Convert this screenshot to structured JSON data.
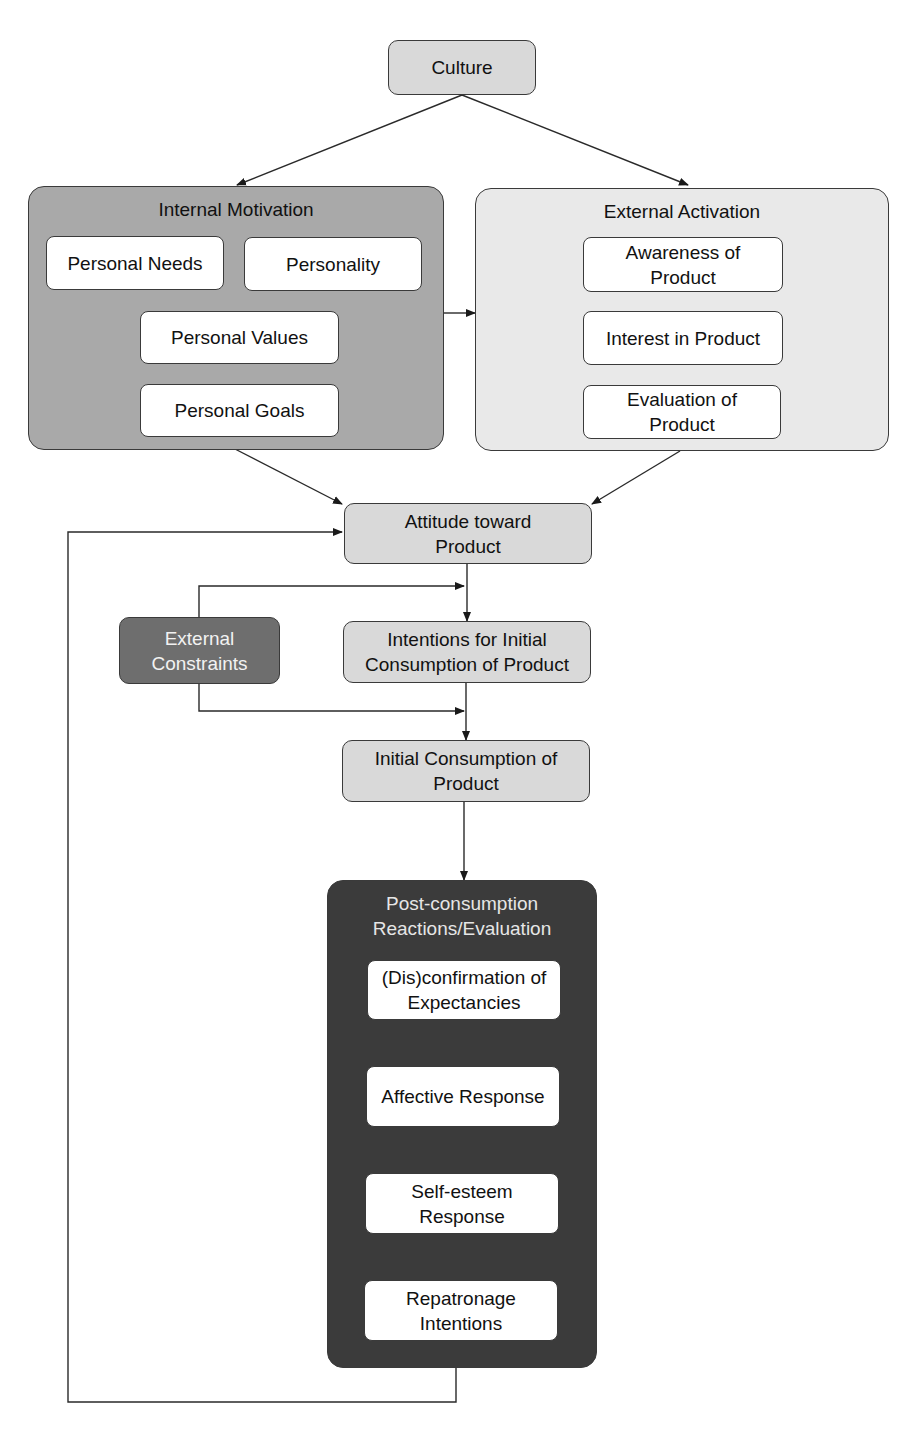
{
  "diagram": {
    "culture": "Culture",
    "internal_motivation": {
      "title": "Internal Motivation",
      "personal_needs": "Personal Needs",
      "personality": "Personality",
      "personal_values": "Personal Values",
      "personal_goals": "Personal Goals"
    },
    "external_activation": {
      "title": "External Activation",
      "awareness": "Awareness of Product",
      "interest": "Interest in Product",
      "evaluation": "Evaluation of Product"
    },
    "attitude": "Attitude toward Product",
    "external_constraints": "External Constraints",
    "intentions": "Intentions for Initial Consumption of Product",
    "initial_consumption": "Initial Consumption of Product",
    "post_consumption": {
      "title": "Post-consumption Reactions/Evaluation",
      "disconfirmation": "(Dis)confirmation of Expectancies",
      "affective": "Affective Response",
      "self_esteem": "Self-esteem Response",
      "repatronage": "Repatronage Intentions"
    }
  },
  "colors": {
    "culture_fill": "#d9d9d9",
    "internal_fill": "#a9a9a9",
    "external_fill": "#e9e9e9",
    "constraints_fill": "#6e6e6e",
    "post_fill": "#3b3b3b",
    "line": "#2a2a2a"
  }
}
